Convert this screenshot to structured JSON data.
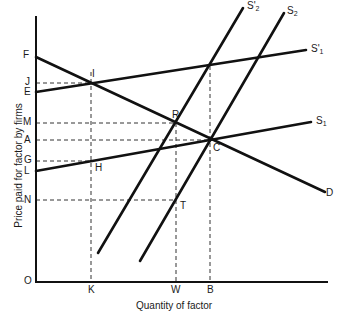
{
  "diagram": {
    "axis_labels": {
      "y": "Price paid for factor by firms",
      "x": "Quantity of factor"
    },
    "origin_label": "O",
    "y_ticks": [
      "F",
      "J",
      "E",
      "M",
      "A",
      "G",
      "L",
      "N"
    ],
    "x_ticks": [
      "K",
      "W",
      "B"
    ],
    "points": [
      "I",
      "R",
      "C",
      "H",
      "T"
    ],
    "curves": [
      {
        "id": "D",
        "label": "D",
        "description": "Demand curve from F to D (downward sloping)"
      },
      {
        "id": "S1",
        "label_main": "S",
        "label_sub": "1",
        "description": "Supply curve from L"
      },
      {
        "id": "S1prime",
        "label_main": "S'",
        "label_sub": "1",
        "description": "Supply curve from E"
      },
      {
        "id": "S2",
        "label_main": "S",
        "label_sub": "2",
        "description": "Steep supply curve (right)"
      },
      {
        "id": "S2prime",
        "label_main": "S'",
        "label_sub": "2",
        "description": "Steep supply curve (left)"
      }
    ],
    "labels": {
      "F": "F",
      "J": "J",
      "E": "E",
      "M": "M",
      "A": "A",
      "G": "G",
      "L": "L",
      "N": "N",
      "O": "O",
      "K": "K",
      "W": "W",
      "B": "B",
      "I": "I",
      "R": "R",
      "C": "C",
      "H": "H",
      "T": "T",
      "D": "D",
      "S1_main": "S",
      "S1_sub": "1",
      "S1p_main": "S'",
      "S1p_sub": "1",
      "S2_main": "S",
      "S2_sub": "2",
      "S2p_main": "S'",
      "S2p_sub": "2"
    },
    "colors": {
      "line": "#111111",
      "dashed": "#333333",
      "text": "#1a1a1a"
    }
  }
}
